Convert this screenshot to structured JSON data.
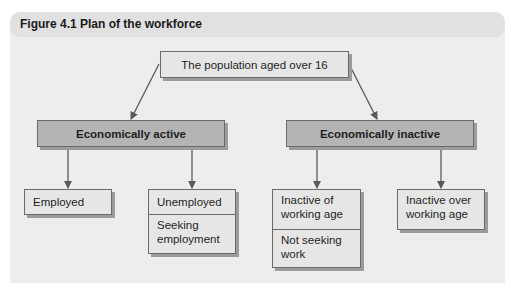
{
  "figure": {
    "title": "Figure 4.1  Plan of the workforce"
  },
  "nodes": {
    "root": {
      "label": "The population aged over 16"
    },
    "active": {
      "label": "Economically active"
    },
    "inactive": {
      "label": "Economically inactive"
    },
    "employed": {
      "label": "Employed"
    },
    "unemployed": {
      "label": "Unemployed",
      "sublabel": "Seeking employment"
    },
    "inactive_working_age": {
      "label": "Inactive of working age",
      "sublabel": "Not seeking work"
    },
    "inactive_over_working_age": {
      "label": "Inactive over working age"
    }
  },
  "edges": [
    {
      "from": "root",
      "to": "active"
    },
    {
      "from": "root",
      "to": "inactive"
    },
    {
      "from": "active",
      "to": "employed"
    },
    {
      "from": "active",
      "to": "unemployed"
    },
    {
      "from": "inactive",
      "to": "inactive_working_age"
    },
    {
      "from": "inactive",
      "to": "inactive_over_working_age"
    }
  ],
  "colors": {
    "panel": "#ededed",
    "header": "#e1e1e1",
    "category_fill": "#b4b4b4",
    "leaf_fill": "#e6e6e6",
    "arrow": "#5a5a5a"
  }
}
